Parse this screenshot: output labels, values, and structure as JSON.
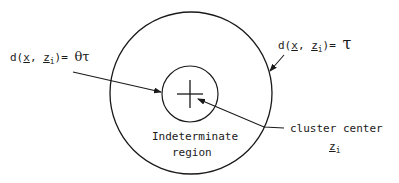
{
  "diagram": {
    "labels": {
      "inner_boundary": {
        "func": "d(",
        "var_x": "x",
        "comma": ", ",
        "var_z": "z",
        "sub_i": "i",
        "close_eq": ")= ",
        "rhs": "θτ"
      },
      "outer_boundary": {
        "func": "d(",
        "var_x": "x",
        "comma": ", ",
        "var_z": "z",
        "sub_i": "i",
        "close_eq": ")= ",
        "rhs": "τ"
      },
      "region": {
        "line1": "Indeterminate",
        "line2": "region"
      },
      "cluster_center": {
        "line1": "cluster center",
        "var_z": "z",
        "sub_i": "i"
      }
    },
    "shapes": {
      "outer_circle": {
        "cx": 191,
        "cy": 93,
        "r": 81
      },
      "inner_circle": {
        "cx": 190,
        "cy": 94,
        "r": 28
      },
      "center_cross": {
        "cx": 190,
        "cy": 94,
        "half": 12
      }
    },
    "colors": {
      "ink": "#1a1a1a",
      "background": "#ffffff"
    }
  }
}
